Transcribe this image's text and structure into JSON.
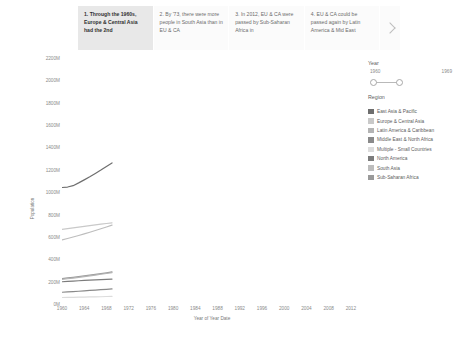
{
  "story": {
    "tabs": [
      {
        "label": "1. Through the 1960s, Europe & Central Asia had the 2nd",
        "active": true
      },
      {
        "label": "2. By '73, there were more people in South Asia than in EU & CA",
        "active": false
      },
      {
        "label": "3. In 2012, EU & CA were passed by Sub-Saharan Africa in",
        "active": false
      },
      {
        "label": "4. EU & CA could be passed again by Latin America & Mid East",
        "active": false
      }
    ],
    "next_icon": "chevron-right-icon"
  },
  "filters": {
    "year": {
      "title": "Year",
      "min_label": "1960",
      "max_label": "1969"
    },
    "region": {
      "title": "Region",
      "items": [
        {
          "label": "East Asia & Pacific",
          "color": "#6e6e6e"
        },
        {
          "label": "Europe & Central Asia",
          "color": "#c9c9c9"
        },
        {
          "label": "Latin America & Caribbean",
          "color": "#b4b4b4"
        },
        {
          "label": "Middle East & North Africa",
          "color": "#8a8a8a"
        },
        {
          "label": "Multiple - Small Countries",
          "color": "#dcdcdc"
        },
        {
          "label": "North America",
          "color": "#7c7c7c"
        },
        {
          "label": "South Asia",
          "color": "#bdbdbd"
        },
        {
          "label": "Sub-Saharan Africa",
          "color": "#9a9a9a"
        }
      ]
    }
  },
  "chart_data": {
    "type": "line",
    "title": "",
    "xlabel": "Year of Year Date",
    "ylabel": "Population",
    "xlim": [
      1960,
      2014
    ],
    "ylim": [
      0,
      2200
    ],
    "grid": false,
    "legend_position": "right",
    "xticks": [
      1960,
      1964,
      1968,
      1972,
      1976,
      1980,
      1984,
      1988,
      1992,
      1996,
      2000,
      2004,
      2008,
      2012
    ],
    "yticks": [
      0,
      200,
      400,
      600,
      800,
      1000,
      1200,
      1400,
      1600,
      1800,
      2000,
      2200
    ],
    "ytick_labels": [
      "0M",
      "200M",
      "400M",
      "600M",
      "800M",
      "1000M",
      "1200M",
      "1400M",
      "1600M",
      "1800M",
      "2000M",
      "2200M"
    ],
    "x": [
      1960,
      1961,
      1962,
      1963,
      1964,
      1965,
      1966,
      1967,
      1968,
      1969
    ],
    "series": [
      {
        "name": "East Asia & Pacific",
        "color": "#6e6e6e",
        "values": [
          1042,
          1046,
          1058,
          1083,
          1110,
          1138,
          1168,
          1198,
          1230,
          1262
        ]
      },
      {
        "name": "Europe & Central Asia",
        "color": "#c9c9c9",
        "values": [
          667,
          674,
          681,
          688,
          695,
          701,
          708,
          714,
          720,
          726
        ]
      },
      {
        "name": "South Asia",
        "color": "#bdbdbd",
        "values": [
          573,
          586,
          599,
          613,
          627,
          642,
          657,
          673,
          689,
          706
        ]
      },
      {
        "name": "Sub-Saharan Africa",
        "color": "#9a9a9a",
        "values": [
          227,
          233,
          239,
          245,
          251,
          258,
          265,
          272,
          279,
          287
        ]
      },
      {
        "name": "Latin America & Caribbean",
        "color": "#b4b4b4",
        "values": [
          220,
          226,
          232,
          238,
          245,
          252,
          259,
          266,
          273,
          280
        ]
      },
      {
        "name": "North America",
        "color": "#7c7c7c",
        "values": [
          199,
          202,
          205,
          208,
          211,
          213,
          216,
          218,
          220,
          223
        ]
      },
      {
        "name": "Middle East & North Africa",
        "color": "#8a8a8a",
        "values": [
          105,
          108,
          111,
          114,
          117,
          121,
          124,
          128,
          131,
          135
        ]
      },
      {
        "name": "Multiple - Small Countries",
        "color": "#dcdcdc",
        "values": [
          58,
          59,
          60,
          61,
          62,
          63,
          64,
          65,
          67,
          68
        ]
      }
    ]
  }
}
